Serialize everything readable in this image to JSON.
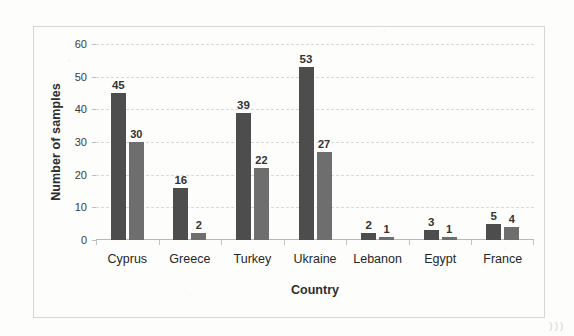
{
  "chart_data": {
    "type": "bar",
    "title": "",
    "xlabel": "Country",
    "ylabel": "Number of samples",
    "categories": [
      "Cyprus",
      "Greece",
      "Turkey",
      "Ukraine",
      "Lebanon",
      "Egypt",
      "France"
    ],
    "series": [
      {
        "name": "series-1",
        "color": "#4d4d4d",
        "values": [
          45,
          16,
          39,
          53,
          2,
          3,
          5
        ]
      },
      {
        "name": "series-2",
        "color": "#6e6e6e",
        "values": [
          30,
          2,
          22,
          27,
          1,
          1,
          4
        ]
      }
    ],
    "ylim": [
      0,
      60
    ],
    "yticks": [
      0,
      10,
      20,
      30,
      40,
      50,
      60
    ],
    "ytick_labels": [
      "0",
      "10",
      "20",
      "30",
      "40",
      "50",
      "60"
    ],
    "grid": true,
    "grid_style": "dashed-horizontal",
    "legend": "none",
    "data_labels": true,
    "frame": true,
    "frame_color": "#d6d6d6",
    "background": "#fdfdfc"
  },
  "artifacts": {
    "bottom_right_marks": ")))"
  }
}
